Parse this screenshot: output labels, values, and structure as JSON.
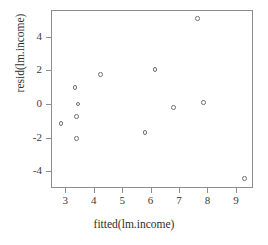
{
  "chart_data": {
    "type": "scatter",
    "title": "",
    "xlabel": "fitted(lm.income)",
    "ylabel": "resid(lm.income)",
    "xlim": [
      2.5,
      9.6
    ],
    "ylim": [
      -5.0,
      5.6
    ],
    "xticks": [
      3,
      4,
      5,
      6,
      7,
      8,
      9
    ],
    "xticklabels": [
      "3",
      "4",
      "5",
      "6",
      "7",
      "8",
      "9"
    ],
    "yticks": [
      -4,
      -2,
      0,
      2,
      4
    ],
    "yticklabels": [
      "-4",
      "-2",
      "0",
      "2",
      "4"
    ],
    "grid": false,
    "legend": null,
    "marker": "open-circle",
    "marker_color": "#6f6f6f",
    "frame_color": "#8d8d8d",
    "points": [
      {
        "x": 2.85,
        "y": -1.15
      },
      {
        "x": 3.35,
        "y": 1.0
      },
      {
        "x": 3.4,
        "y": -0.75
      },
      {
        "x": 3.45,
        "y": 0.0
      },
      {
        "x": 3.4,
        "y": -2.05
      },
      {
        "x": 4.25,
        "y": 1.75
      },
      {
        "x": 5.8,
        "y": -1.7
      },
      {
        "x": 6.15,
        "y": 2.05
      },
      {
        "x": 6.8,
        "y": -0.2
      },
      {
        "x": 7.65,
        "y": 5.1
      },
      {
        "x": 7.85,
        "y": 0.1
      },
      {
        "x": 9.3,
        "y": -4.45
      }
    ]
  }
}
